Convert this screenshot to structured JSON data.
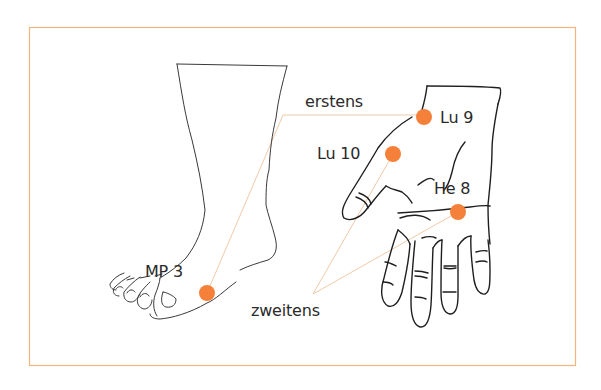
{
  "diagram": {
    "title": "",
    "colors": {
      "frame": "#f4b47c",
      "point": "#f5803a",
      "connector": "#f2c9a6",
      "outline": "#2a2a2a"
    },
    "figures": [
      {
        "id": "foot",
        "label": "Fuß"
      },
      {
        "id": "hand",
        "label": "Hand"
      }
    ],
    "points": [
      {
        "id": "mp3",
        "label": "MP 3",
        "x": 207,
        "y": 293
      },
      {
        "id": "lu9",
        "label": "Lu 9",
        "x": 424,
        "y": 117
      },
      {
        "id": "lu10",
        "label": "Lu 10",
        "x": 393,
        "y": 154
      },
      {
        "id": "he8",
        "label": "He 8",
        "x": 458,
        "y": 212
      }
    ],
    "groups": [
      {
        "id": "erstens",
        "label": "erstens",
        "connects": [
          "mp3",
          "lu9"
        ]
      },
      {
        "id": "zweitens",
        "label": "zweitens",
        "connects": [
          "lu10",
          "he8"
        ]
      }
    ]
  }
}
